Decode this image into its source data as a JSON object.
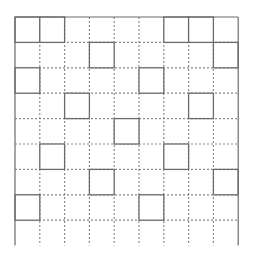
{
  "diagram": {
    "type": "grid-pattern",
    "rows": 9,
    "cols": 9,
    "origin": {
      "x": 15,
      "y": 17
    },
    "cell_width": 24.8,
    "cell_height": 25.4,
    "colors": {
      "background": "#ffffff",
      "solid_line": "#6b6b6b",
      "dotted_line": "#8a8a8a"
    },
    "outer_border": {
      "top": true,
      "left": true,
      "right": true,
      "bottom": false
    },
    "solid_cells": [
      {
        "row": 0,
        "col": 0
      },
      {
        "row": 0,
        "col": 1
      },
      {
        "row": 0,
        "col": 6
      },
      {
        "row": 0,
        "col": 7
      },
      {
        "row": 1,
        "col": 3
      },
      {
        "row": 1,
        "col": 8
      },
      {
        "row": 2,
        "col": 0
      },
      {
        "row": 2,
        "col": 5
      },
      {
        "row": 3,
        "col": 2
      },
      {
        "row": 3,
        "col": 7
      },
      {
        "row": 4,
        "col": 4
      },
      {
        "row": 5,
        "col": 1
      },
      {
        "row": 5,
        "col": 6
      },
      {
        "row": 6,
        "col": 3
      },
      {
        "row": 6,
        "col": 8
      },
      {
        "row": 7,
        "col": 0
      },
      {
        "row": 7,
        "col": 5
      }
    ]
  }
}
